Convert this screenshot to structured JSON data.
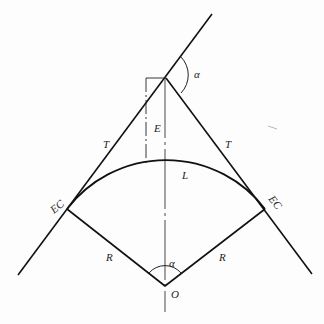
{
  "diagram": {
    "type": "circular-curve-geometry",
    "labels": {
      "deflection_angle_top": "α",
      "external_distance": "E",
      "tangent_left": "T",
      "tangent_right": "T",
      "curve_length": "L",
      "point_left": "EC",
      "point_right": "EC",
      "radius_left": "R",
      "radius_right": "R",
      "central_angle": "α",
      "center": "O"
    },
    "points": {
      "PI": [
        166,
        78
      ],
      "EC_left": [
        67,
        209
      ],
      "EC_right": [
        265,
        209
      ],
      "O": [
        165,
        286
      ],
      "arc_top": [
        165,
        163
      ]
    },
    "colors": {
      "line": "#111111",
      "background": "#fdfdfd"
    }
  }
}
